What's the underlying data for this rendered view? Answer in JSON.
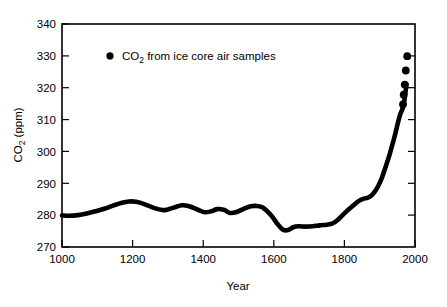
{
  "chart_data": {
    "type": "line",
    "title": "",
    "xlabel": "Year",
    "ylabel": "CO2 (ppm)",
    "ylabel_parts": {
      "pre": "CO",
      "sub": "2",
      "post": " (ppm)"
    },
    "xlim": [
      1000,
      2000
    ],
    "ylim": [
      270,
      340
    ],
    "xticks": [
      1000,
      1200,
      1400,
      1600,
      1800,
      2000
    ],
    "yticks": [
      270,
      280,
      290,
      300,
      310,
      320,
      330,
      340
    ],
    "grid": false,
    "legend": {
      "position": "inside-top-left",
      "marker": "filled-circle",
      "entries": [
        {
          "label_pre": "CO",
          "label_sub": "2",
          "label_post": " from ice core air samples"
        }
      ]
    },
    "series": [
      {
        "name": "CO2 from ice core air samples",
        "marker": "filled-circle",
        "color": "#000000",
        "x": [
          1000,
          1020,
          1045,
          1070,
          1095,
          1120,
          1145,
          1170,
          1190,
          1210,
          1235,
          1260,
          1285,
          1300,
          1320,
          1340,
          1360,
          1385,
          1405,
          1425,
          1440,
          1460,
          1475,
          1495,
          1515,
          1535,
          1550,
          1565,
          1580,
          1595,
          1610,
          1625,
          1640,
          1655,
          1670,
          1690,
          1710,
          1730,
          1750,
          1765,
          1780,
          1795,
          1810,
          1825,
          1840,
          1855,
          1865,
          1875,
          1885,
          1895,
          1905,
          1912,
          1920,
          1928,
          1935,
          1942,
          1948,
          1953,
          1958,
          1963,
          1968,
          1972,
          1976
        ],
        "y": [
          279.9,
          279.8,
          280.0,
          280.5,
          281.2,
          282.0,
          283.0,
          283.9,
          284.3,
          284.2,
          283.4,
          282.3,
          281.6,
          281.8,
          282.5,
          283.1,
          282.8,
          281.7,
          280.9,
          281.3,
          281.9,
          281.6,
          280.7,
          281.0,
          282.0,
          282.8,
          282.9,
          282.6,
          281.4,
          279.6,
          277.3,
          275.5,
          275.3,
          276.2,
          276.5,
          276.4,
          276.5,
          276.8,
          277.0,
          277.3,
          278.4,
          280.0,
          281.6,
          283.0,
          284.4,
          285.2,
          285.4,
          286.0,
          287.2,
          289.0,
          291.4,
          293.6,
          296.2,
          299.0,
          301.8,
          304.6,
          307.3,
          309.6,
          311.6,
          312.9,
          314.8,
          317.8,
          321.0
        ],
        "detached_points": [
          {
            "x": 1966,
            "y": 314.8
          },
          {
            "x": 1968,
            "y": 317.8
          },
          {
            "x": 1971,
            "y": 321.0
          },
          {
            "x": 1974,
            "y": 325.4
          },
          {
            "x": 1978,
            "y": 329.9
          }
        ]
      }
    ]
  }
}
